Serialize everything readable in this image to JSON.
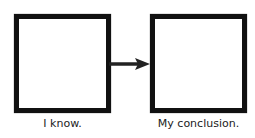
{
  "diagram": {
    "type": "flow",
    "boxes": [
      {
        "id": "left",
        "label": "I know.",
        "content": ""
      },
      {
        "id": "right",
        "label": "My conclusion.",
        "content": ""
      }
    ],
    "connector": {
      "from": "left",
      "to": "right",
      "icon": "arrow-right-icon"
    },
    "colors": {
      "border": "#111111",
      "background": "#ffffff",
      "text": "#222222"
    }
  }
}
